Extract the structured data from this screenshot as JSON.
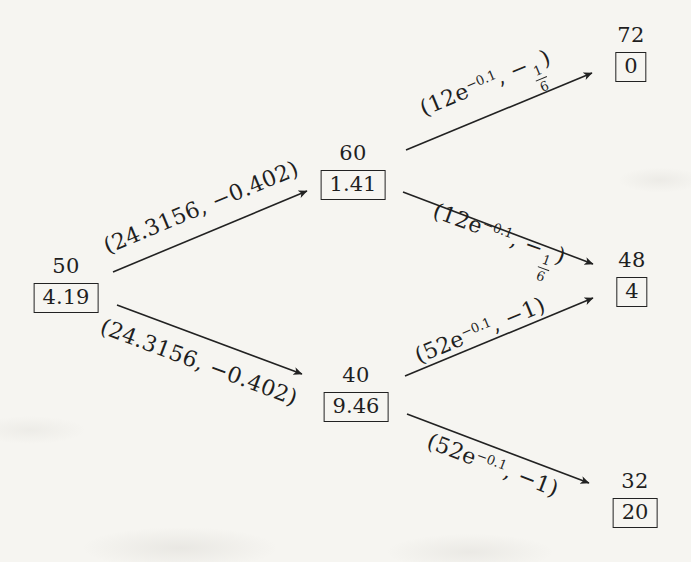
{
  "figure": {
    "type": "binomial-tree",
    "line_color": "#222222",
    "paper_color": "#f6f5f1"
  },
  "nodes": {
    "root": {
      "price": "50",
      "value": "4.19"
    },
    "up": {
      "price": "60",
      "value": "1.41"
    },
    "down": {
      "price": "40",
      "value": "9.46"
    },
    "up_up": {
      "price": "72",
      "value": "0"
    },
    "middle": {
      "price": "48",
      "value": "4"
    },
    "down_down": {
      "price": "32",
      "value": "20"
    }
  },
  "edges": {
    "root_up": {
      "label": "(24.3156, −0.402)"
    },
    "root_down": {
      "label": "(24.3156, −0.402)"
    },
    "up_upup": {
      "pre": "(12e",
      "sup": "−0.1",
      "mid": ", −",
      "frac_num": "1",
      "frac_den": "6",
      "post": ")"
    },
    "up_mid": {
      "pre": "(12e",
      "sup": "−0.1",
      "mid": ", −",
      "frac_num": "1",
      "frac_den": "6",
      "post": ")"
    },
    "down_mid": {
      "pre": "(52e",
      "sup": "−0.1",
      "post": ", −1)"
    },
    "down_down2": {
      "pre": "(52e",
      "sup": "−0.1",
      "post": ", −1)"
    }
  }
}
